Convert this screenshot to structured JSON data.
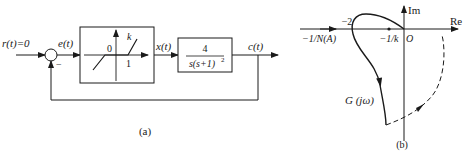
{
  "diagram_a": {
    "caption": "(a)",
    "input_label": "r(t)=0",
    "error_label": "e(t)",
    "summing_sign": "−",
    "nonlinear_block": {
      "origin_label": "0",
      "slope_label": "k",
      "deadzone_label": "1"
    },
    "intermediate_label": "x(t)",
    "plant_block": {
      "numerator": "4",
      "denominator": "s(s+1)",
      "denominator_exp": "2"
    },
    "output_label": "c(t)"
  },
  "diagram_b": {
    "caption": "(b)",
    "im_axis_label": "Im",
    "re_axis_label": "Re",
    "origin_label": "O",
    "neg_two_label": "−2",
    "describing_fn_label": "−1/N(A)",
    "neg_inv_k_label": "−1/k",
    "nyquist_label": "G (jω)"
  }
}
